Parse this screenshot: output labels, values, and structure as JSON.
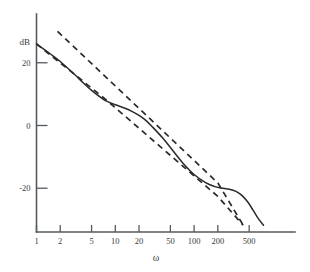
{
  "chart_data": {
    "type": "line",
    "title": "",
    "xlabel": "ω",
    "ylabel": "dB",
    "xscale": "log",
    "xlim": [
      1,
      1000
    ],
    "ylim": [
      -32,
      30
    ],
    "grid": false,
    "legend": null,
    "x_ticks": [
      {
        "value": 1,
        "label": "1"
      },
      {
        "value": 2,
        "label": "2"
      },
      {
        "value": 5,
        "label": "5"
      },
      {
        "value": 10,
        "label": "10"
      },
      {
        "value": 20,
        "label": "20"
      },
      {
        "value": 50,
        "label": "50"
      },
      {
        "value": 100,
        "label": "100"
      },
      {
        "value": 200,
        "label": "200"
      },
      {
        "value": 500,
        "label": "500"
      }
    ],
    "y_ticks": [
      {
        "value": 20,
        "label": "20"
      },
      {
        "value": 0,
        "label": "0"
      },
      {
        "value": -20,
        "label": "-20"
      }
    ],
    "series": [
      {
        "name": "exact-magnitude",
        "style": "solid",
        "points": [
          {
            "x": 1,
            "y": 26.0
          },
          {
            "x": 1.5,
            "y": 22.8
          },
          {
            "x": 2,
            "y": 20.4
          },
          {
            "x": 3,
            "y": 16.4
          },
          {
            "x": 4,
            "y": 13.4
          },
          {
            "x": 5,
            "y": 11.2
          },
          {
            "x": 7,
            "y": 8.4
          },
          {
            "x": 8,
            "y": 7.6
          },
          {
            "x": 10,
            "y": 6.6
          },
          {
            "x": 13,
            "y": 5.6
          },
          {
            "x": 16,
            "y": 4.6
          },
          {
            "x": 20,
            "y": 3.2
          },
          {
            "x": 25,
            "y": 1.4
          },
          {
            "x": 30,
            "y": -0.6
          },
          {
            "x": 40,
            "y": -4.0
          },
          {
            "x": 50,
            "y": -7.0
          },
          {
            "x": 70,
            "y": -11.6
          },
          {
            "x": 100,
            "y": -15.6
          },
          {
            "x": 140,
            "y": -18.2
          },
          {
            "x": 180,
            "y": -19.4
          },
          {
            "x": 220,
            "y": -19.9
          },
          {
            "x": 280,
            "y": -20.3
          },
          {
            "x": 340,
            "y": -21.0
          },
          {
            "x": 400,
            "y": -22.2
          },
          {
            "x": 480,
            "y": -24.4
          },
          {
            "x": 560,
            "y": -27.0
          },
          {
            "x": 650,
            "y": -29.6
          },
          {
            "x": 760,
            "y": -31.8
          }
        ]
      },
      {
        "name": "asymptote-upper",
        "style": "dashed",
        "points": [
          {
            "x": 1.85,
            "y": 30.0
          },
          {
            "x": 200,
            "y": -18.3
          },
          {
            "x": 420,
            "y": -31.8
          }
        ]
      },
      {
        "name": "asymptote-lower",
        "style": "dashed",
        "points": [
          {
            "x": 1,
            "y": 26.0
          },
          {
            "x": 7.4,
            "y": 8.5
          },
          {
            "x": 200,
            "y": -22.6
          },
          {
            "x": 420,
            "y": -31.8
          }
        ]
      }
    ]
  }
}
